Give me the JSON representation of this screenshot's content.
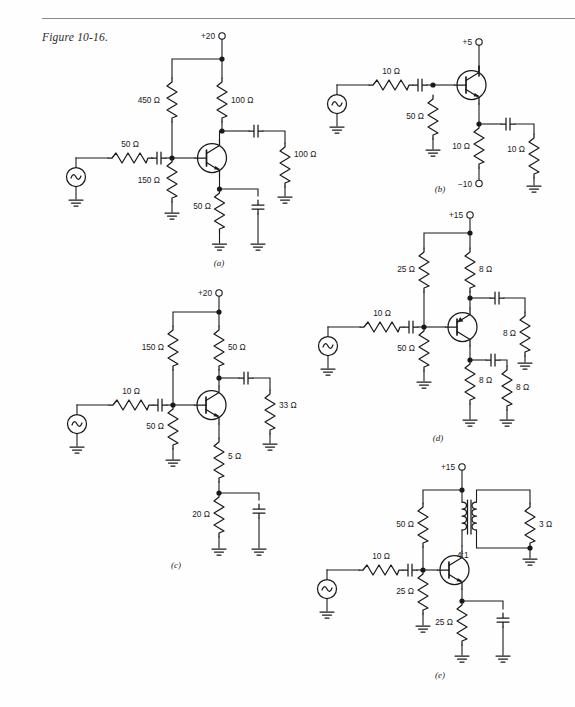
{
  "figure": {
    "caption": "Figure 10-16."
  },
  "units": {
    "ohm": "Ω"
  },
  "circuits": [
    {
      "id": "a",
      "label": "(a)",
      "supply": "+20",
      "source": "ac-source",
      "components": [
        {
          "name": "source-resistor",
          "value": "50 Ω"
        },
        {
          "name": "bias-resistor-upper",
          "value": "450 Ω"
        },
        {
          "name": "bias-resistor-lower",
          "value": "150 Ω"
        },
        {
          "name": "collector-resistor",
          "value": "100 Ω"
        },
        {
          "name": "load-resistor",
          "value": "100 Ω"
        },
        {
          "name": "emitter-resistor",
          "value": "50 Ω"
        }
      ],
      "transistor": "npn",
      "capacitors": [
        "input-coupling",
        "output-coupling",
        "emitter-bypass"
      ]
    },
    {
      "id": "b",
      "label": "(b)",
      "supply": "+5",
      "negative_supply": "−10",
      "source": "ac-source",
      "components": [
        {
          "name": "source-resistor",
          "value": "10 Ω"
        },
        {
          "name": "base-resistor",
          "value": "50 Ω"
        },
        {
          "name": "emitter-resistor",
          "value": "10 Ω"
        },
        {
          "name": "load-resistor",
          "value": "10 Ω"
        }
      ],
      "transistor": "npn",
      "capacitors": [
        "input-coupling",
        "output-coupling"
      ]
    },
    {
      "id": "c",
      "label": "(c)",
      "supply": "+20",
      "source": "ac-source",
      "components": [
        {
          "name": "source-resistor",
          "value": "10 Ω"
        },
        {
          "name": "bias-resistor-upper",
          "value": "150 Ω"
        },
        {
          "name": "bias-resistor-lower",
          "value": "50 Ω"
        },
        {
          "name": "collector-resistor",
          "value": "50 Ω"
        },
        {
          "name": "load-resistor",
          "value": "33 Ω"
        },
        {
          "name": "emitter-resistor-upper",
          "value": "5 Ω"
        },
        {
          "name": "emitter-resistor-lower",
          "value": "20 Ω"
        }
      ],
      "transistor": "npn",
      "capacitors": [
        "input-coupling",
        "output-coupling",
        "emitter-bypass"
      ]
    },
    {
      "id": "d",
      "label": "(d)",
      "supply": "+15",
      "source": "ac-source",
      "components": [
        {
          "name": "source-resistor",
          "value": "10 Ω"
        },
        {
          "name": "bias-resistor-upper",
          "value": "25 Ω"
        },
        {
          "name": "bias-resistor-lower",
          "value": "50 Ω"
        },
        {
          "name": "collector-resistor",
          "value": "8 Ω"
        },
        {
          "name": "load-resistor",
          "value": "8 Ω"
        },
        {
          "name": "emitter-resistor",
          "value": "8 Ω"
        },
        {
          "name": "emitter-load-resistor",
          "value": "8 Ω"
        }
      ],
      "transistor": "pnp",
      "capacitors": [
        "input-coupling",
        "collector-coupling",
        "emitter-coupling"
      ]
    },
    {
      "id": "e",
      "label": "(e)",
      "supply": "+15",
      "source": "ac-source",
      "transformer_ratio": "4:1",
      "components": [
        {
          "name": "source-resistor",
          "value": "10 Ω"
        },
        {
          "name": "bias-resistor-upper",
          "value": "50 Ω"
        },
        {
          "name": "bias-resistor-lower",
          "value": "25 Ω"
        },
        {
          "name": "load-resistor",
          "value": "3 Ω"
        },
        {
          "name": "emitter-resistor",
          "value": "25 Ω"
        }
      ],
      "transistor": "npn",
      "capacitors": [
        "input-coupling",
        "emitter-bypass"
      ]
    }
  ]
}
